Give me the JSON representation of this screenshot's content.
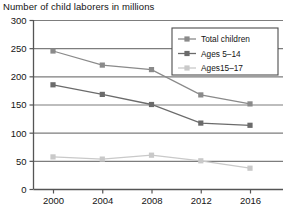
{
  "chart_data": {
    "type": "line",
    "title": "Number of child laborers in millions",
    "xlabel": "",
    "ylabel": "",
    "x": [
      "2000",
      "2004",
      "2008",
      "2012",
      "2016"
    ],
    "categories": [
      "2000",
      "2004",
      "2008",
      "2012",
      "2016"
    ],
    "ylim": [
      0,
      300
    ],
    "yticks": [
      "0",
      "50",
      "100",
      "150",
      "200",
      "250",
      "300"
    ],
    "ytick_values": [
      0,
      50,
      100,
      150,
      200,
      250,
      300
    ],
    "grid": "horizontal",
    "legend_position": "top-right",
    "marker": "square",
    "series": [
      {
        "name": "Total children",
        "values": [
          245,
          220,
          212,
          167,
          151
        ],
        "color": "#8a8a8a"
      },
      {
        "name": "Ages 5–14",
        "values": [
          185,
          168,
          150,
          117,
          113
        ],
        "color": "#6b6b6b"
      },
      {
        "name": "Ages15–17",
        "values": [
          57,
          53,
          60,
          50,
          37
        ],
        "color": "#c9c9c9"
      }
    ]
  },
  "legend": {
    "items": [
      {
        "label": "Total children",
        "color": "#8a8a8a"
      },
      {
        "label": "Ages 5–14",
        "color": "#6b6b6b"
      },
      {
        "label": "Ages15–17",
        "color": "#c9c9c9"
      }
    ]
  },
  "axes": {
    "y_labels": [
      "300",
      "250",
      "200",
      "150",
      "100",
      "50",
      "0"
    ],
    "x_labels": [
      "2000",
      "2004",
      "2008",
      "2012",
      "2016"
    ]
  },
  "colors": {
    "axis": "#555555",
    "grid": "#7d7d7d",
    "text": "#141414",
    "series_total": "#8a8a8a",
    "series_5_14": "#6b6b6b",
    "series_15_17": "#c9c9c9"
  }
}
